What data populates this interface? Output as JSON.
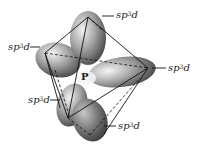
{
  "diagram": {
    "center_atom": "P",
    "orbital_label_base": "sp",
    "orbital_label_sup": "3",
    "orbital_label_tail": "d",
    "labels": [
      {
        "id": "top",
        "base": "sp",
        "sup": "3",
        "tail": "d"
      },
      {
        "id": "left",
        "base": "sp",
        "sup": "3",
        "tail": "d"
      },
      {
        "id": "right",
        "base": "sp",
        "sup": "3",
        "tail": "d"
      },
      {
        "id": "lower-left",
        "base": "sp",
        "sup": "3",
        "tail": "d"
      },
      {
        "id": "bottom",
        "base": "sp",
        "sup": "3",
        "tail": "d"
      }
    ],
    "colors": {
      "lobe_light": "#e6e6e6",
      "lobe_mid": "#9a9a9a",
      "lobe_dark": "#4a4a4a",
      "lines": "#111111",
      "text": "#1a1a1a"
    }
  }
}
